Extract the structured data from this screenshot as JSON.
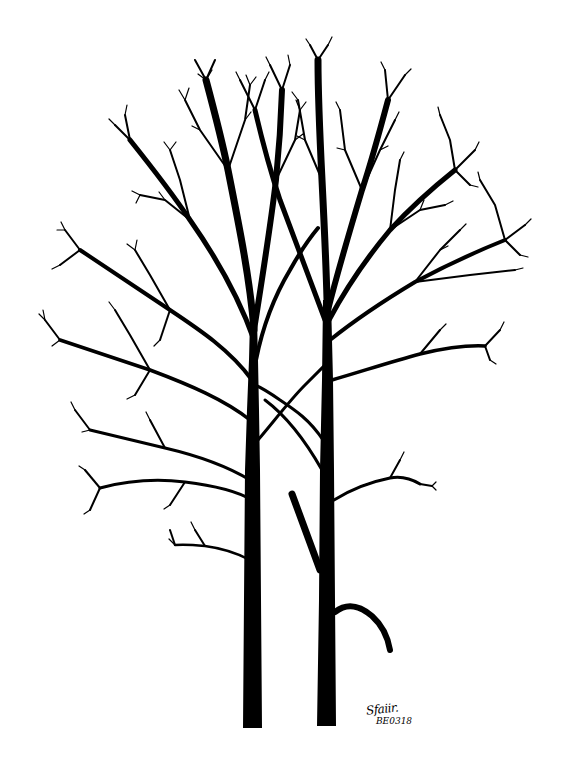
{
  "image": {
    "subject": "Two bare deciduous trees, pen and ink drawing",
    "background_color": "#ffffff",
    "ink_color": "#000000"
  },
  "artwork": {
    "trees": [
      {
        "name": "left-tree",
        "trunk_base_x": 252,
        "trunk_top_y": 330,
        "base_y": 728
      },
      {
        "name": "right-tree",
        "trunk_base_x": 326,
        "trunk_top_y": 290,
        "base_y": 726
      }
    ]
  },
  "signature": {
    "name": "Sfaiir.",
    "date": "BE0318"
  }
}
